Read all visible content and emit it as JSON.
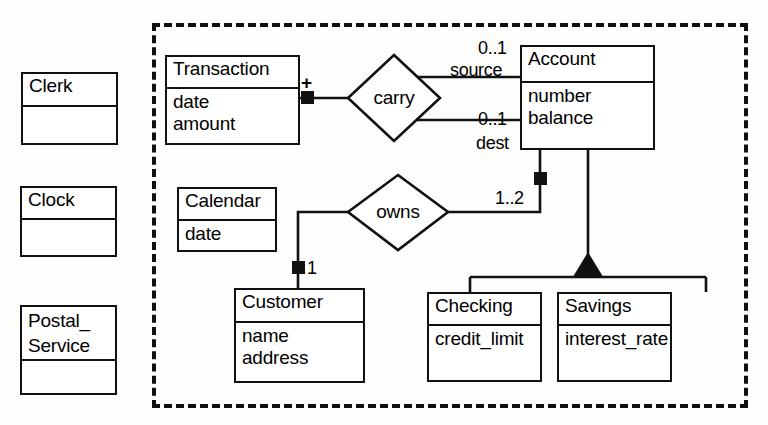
{
  "diagram": {
    "notation": "UML class diagram",
    "colors": {
      "line": "#111111",
      "fill": "#ffffff",
      "background": "#fdfdfc"
    },
    "boundary": {
      "label": "system-boundary",
      "style": "dashed",
      "x": 152,
      "y": 23,
      "width": 596,
      "height": 385
    },
    "classes": [
      {
        "id": "clerk",
        "name": "Clerk",
        "attributes": "",
        "x": 21,
        "y": 72,
        "width": 97,
        "height": 73,
        "name_height": 33,
        "inside_boundary": false
      },
      {
        "id": "clock",
        "name": "Clock",
        "attributes": "",
        "x": 20,
        "y": 186,
        "width": 97,
        "height": 71,
        "name_height": 32,
        "inside_boundary": false
      },
      {
        "id": "postal_service",
        "name": "Postal_\nService",
        "attributes": "",
        "x": 20,
        "y": 305,
        "width": 97,
        "height": 90,
        "name_height": 54,
        "inside_boundary": false
      },
      {
        "id": "transaction",
        "name": "Transaction",
        "attributes": "date\namount",
        "x": 165,
        "y": 55,
        "width": 135,
        "height": 90,
        "name_height": 32,
        "inside_boundary": true
      },
      {
        "id": "account",
        "name": "Account",
        "attributes": "number\nbalance",
        "x": 520,
        "y": 45,
        "width": 135,
        "height": 105,
        "name_height": 36,
        "inside_boundary": true
      },
      {
        "id": "calendar",
        "name": "Calendar",
        "attributes": "date",
        "x": 177,
        "y": 187,
        "width": 100,
        "height": 65,
        "name_height": 32,
        "inside_boundary": true
      },
      {
        "id": "customer",
        "name": "Customer",
        "attributes": "name\naddress",
        "x": 234,
        "y": 288,
        "width": 131,
        "height": 95,
        "name_height": 33,
        "inside_boundary": true
      },
      {
        "id": "checking",
        "name": "Checking",
        "attributes": "credit_limit",
        "x": 427,
        "y": 292,
        "width": 115,
        "height": 90,
        "name_height": 32,
        "inside_boundary": true
      },
      {
        "id": "savings",
        "name": "Savings",
        "attributes": "interest_rate",
        "x": 557,
        "y": 292,
        "width": 115,
        "height": 90,
        "name_height": 32,
        "inside_boundary": true
      }
    ],
    "relationships": [
      {
        "id": "carry",
        "name": "carry",
        "shape": "diamond",
        "cx": 394,
        "cy": 98,
        "rx": 46,
        "ry": 43,
        "connects": [
          "transaction",
          "account"
        ]
      },
      {
        "id": "owns",
        "name": "owns",
        "shape": "diamond",
        "cx": 398,
        "cy": 212,
        "rx": 50,
        "ry": 38,
        "connects": [
          "customer",
          "account"
        ]
      }
    ],
    "edge_labels": [
      {
        "id": "source-multiplicity",
        "text": "0..1",
        "x": 478,
        "y": 38
      },
      {
        "id": "source-role",
        "text": "source",
        "x": 450,
        "y": 60
      },
      {
        "id": "dest-multiplicity",
        "text": "0..1",
        "x": 478,
        "y": 109
      },
      {
        "id": "dest-role",
        "text": "dest",
        "x": 476,
        "y": 133
      },
      {
        "id": "account-multiplicity",
        "text": "1..2",
        "x": 495,
        "y": 188
      },
      {
        "id": "customer-multiplicity",
        "text": "1",
        "x": 307,
        "y": 258
      }
    ],
    "adornments": [
      {
        "id": "transaction-aggregation",
        "type": "filled-square",
        "x": 307,
        "y": 97
      },
      {
        "id": "transaction-plus",
        "type": "plus-sign",
        "x": 305,
        "y": 76,
        "text": "+"
      },
      {
        "id": "account-aggregation",
        "type": "filled-square",
        "x": 540,
        "y": 178
      },
      {
        "id": "customer-aggregation",
        "type": "filled-square",
        "x": 298,
        "y": 267
      },
      {
        "id": "generalization-triangle",
        "type": "filled-triangle",
        "apex_x": 588,
        "apex_y": 254,
        "base_y": 277,
        "half_width": 14
      }
    ]
  }
}
